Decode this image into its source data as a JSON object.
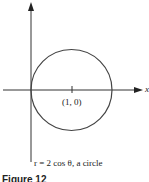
{
  "diagram": {
    "axes": {
      "x_label": "x",
      "y_label": "y"
    },
    "center_label": "(1, 0)",
    "caption": "r = 2 cos θ, a circle",
    "figure_label": "Figure 12",
    "colors": {
      "stroke": "#333333",
      "background": "#ffffff"
    }
  }
}
